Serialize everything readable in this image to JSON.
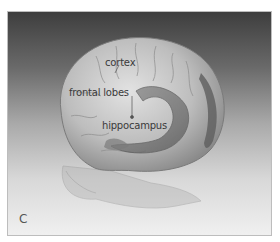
{
  "figure": {
    "panel_letter": "C",
    "labels": {
      "cortex": "cortex",
      "frontal_lobes": "frontal lobes",
      "hippocampus": "hippocampus"
    },
    "colors": {
      "background_top": "#3e3e3e",
      "background_bottom": "#f0f0f0",
      "brain_fill": "#c9c9c9",
      "hippocampus_fill": "#6f6f6f",
      "label_text": "#3a3a3a"
    }
  }
}
